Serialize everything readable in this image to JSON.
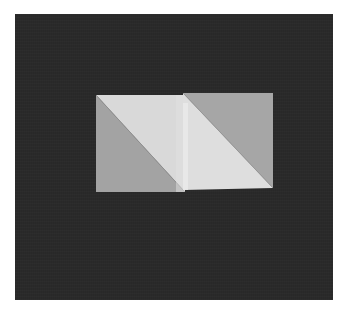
{
  "image": {
    "description": "Photograph of two half-square triangle quilt blocks placed side by side on a dark fabric background",
    "background_color": "#2a2a2a",
    "page_color": "#ffffff"
  },
  "blocks": [
    {
      "name": "left-half-square-triangle",
      "light_color": "#d9d9d9",
      "dark_color": "#a3a3a3",
      "diagonal": "top-left to bottom-right",
      "light_half": "upper-right",
      "dark_half": "lower-left"
    },
    {
      "name": "right-half-square-triangle",
      "light_color": "#dedede",
      "dark_color": "#a6a6a6",
      "diagonal": "top-left to bottom-right",
      "light_half": "lower-left",
      "dark_half": "upper-right"
    }
  ],
  "colors": {
    "light_fabric": "#d9d9d9",
    "dark_fabric": "#a4a4a4",
    "background": "#2a2a2a"
  }
}
